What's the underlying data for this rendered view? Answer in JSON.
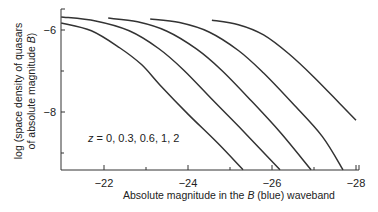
{
  "chart_data": {
    "type": "line",
    "title": "",
    "xlabel": "Absolute magnitude in the B (blue) waveband",
    "xlabel_parts": [
      "Absolute magnitude in the ",
      "B",
      " (blue) waveband"
    ],
    "ylabel": "log (space density of quasars of absolute magnitude B)",
    "ylabel_lines": [
      "log (space density of quasars",
      "of absolute magnitude ",
      "B",
      ")"
    ],
    "xlim": [
      -21,
      -28
    ],
    "ylim": [
      -9.45,
      -5.5
    ],
    "x_ticks": [
      -22,
      -24,
      -26,
      -28
    ],
    "x_tick_labels": [
      "−22",
      "−24",
      "−26",
      "−28"
    ],
    "x_minor_ticks": [
      -23,
      -25,
      -27
    ],
    "y_ticks": [
      -6,
      -8
    ],
    "y_tick_labels": [
      "−6",
      "−8"
    ],
    "y_minor_ticks": [
      -7,
      -9
    ],
    "grid": false,
    "legend": null,
    "annotation": "z = 0, 0.3, 0.6, 1, 2",
    "series": [
      {
        "name": "z = 0",
        "x": [
          -20.98,
          -21.7,
          -22.38,
          -22.9,
          -23.33,
          -24.0,
          -24.7,
          -25.31
        ],
        "y": [
          -5.83,
          -6.02,
          -6.44,
          -6.85,
          -7.34,
          -8.05,
          -8.75,
          -9.41
        ]
      },
      {
        "name": "z = 0.3",
        "x": [
          -20.98,
          -21.8,
          -22.6,
          -23.3,
          -23.9,
          -24.6,
          -25.3,
          -26.19
        ],
        "y": [
          -5.68,
          -5.78,
          -6.02,
          -6.45,
          -6.98,
          -7.72,
          -8.45,
          -9.41
        ]
      },
      {
        "name": "z = 0.6",
        "x": [
          -22.1,
          -22.8,
          -23.5,
          -24.2,
          -24.8,
          -25.5,
          -26.2,
          -26.93
        ],
        "y": [
          -5.71,
          -5.8,
          -6.03,
          -6.46,
          -6.98,
          -7.72,
          -8.5,
          -9.41
        ]
      },
      {
        "name": "z = 1",
        "x": [
          -23.1,
          -23.8,
          -24.5,
          -25.2,
          -25.8,
          -26.5,
          -27.2,
          -27.69
        ],
        "y": [
          -5.73,
          -5.82,
          -6.05,
          -6.5,
          -7.05,
          -7.8,
          -8.6,
          -9.41
        ]
      },
      {
        "name": "z = 2",
        "x": [
          -24.57,
          -25.2,
          -25.8,
          -26.4,
          -27.0,
          -27.6,
          -28.0
        ],
        "y": [
          -5.76,
          -5.87,
          -6.12,
          -6.58,
          -7.15,
          -7.78,
          -8.2
        ]
      }
    ]
  }
}
